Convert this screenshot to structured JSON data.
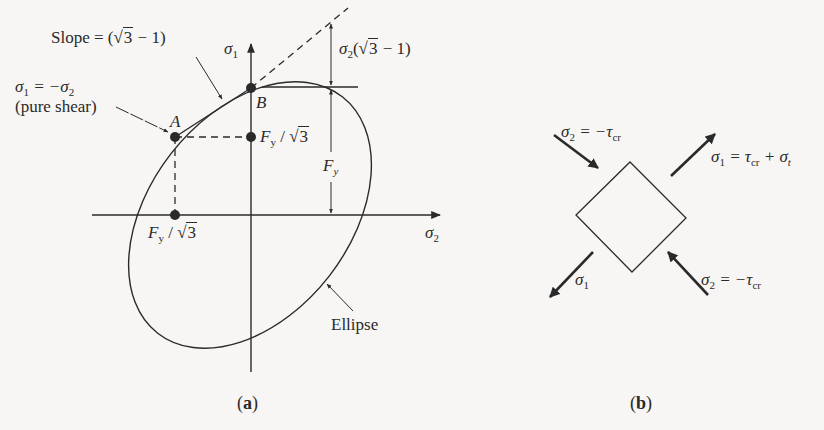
{
  "figure_a": {
    "caption": "a",
    "axes": {
      "vertical": "σ",
      "vertical_sub": "1",
      "horizontal": "σ",
      "horizontal_sub": "2"
    },
    "slope_label": {
      "prefix": "Slope = (",
      "radicand": "3",
      "suffix": " − 1)"
    },
    "pure_shear_label": {
      "line1_a": "σ",
      "line1_sub_a": "1",
      "line1_mid": " = −σ",
      "line1_sub_b": "2",
      "line2": "(pure shear)"
    },
    "point_A": "A",
    "point_B": "B",
    "fy_sqrt3_vertical": {
      "f": "F",
      "sub": "y",
      "slash": " / ",
      "radicand": "3"
    },
    "fy_sqrt3_horizontal": {
      "f": "F",
      "sub": "y",
      "slash": " / ",
      "radicand": "3"
    },
    "fy_dimension": {
      "f": "F",
      "sub": "y"
    },
    "sigma2_dimension": {
      "s": "σ",
      "sub": "2",
      "open": "(",
      "radicand": "3",
      "close": " − 1)"
    },
    "ellipse_label": "Ellipse"
  },
  "figure_b": {
    "caption": "b",
    "top_left_label": {
      "s": "σ",
      "sub": "2",
      "eq": " = −τ",
      "sub2": "cr"
    },
    "top_right_label": {
      "s": "σ",
      "sub": "1",
      "eq": " = τ",
      "sub2": "cr",
      "plus": " + σ",
      "sub3": "t"
    },
    "bottom_left_label": {
      "s": "σ",
      "sub": "1"
    },
    "bottom_right_label": {
      "s": "σ",
      "sub": "2",
      "eq": " = −τ",
      "sub2": "cr"
    }
  },
  "colors": {
    "ink": "#2a2a2a",
    "paper": "#f7f6f4"
  }
}
